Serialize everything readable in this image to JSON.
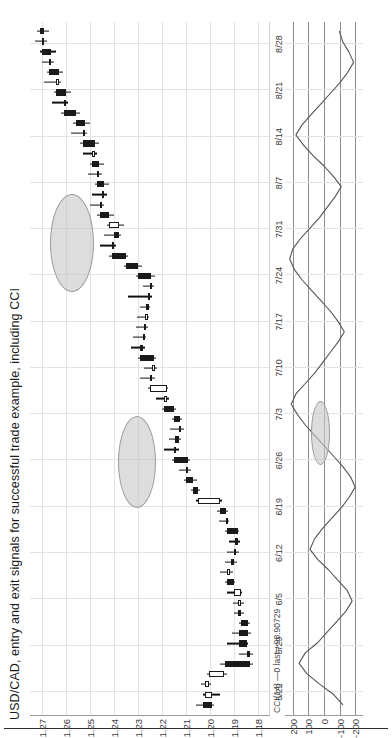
{
  "chart": {
    "title": "USD/CAD, entry and exit signals for successful trade example, including CCI",
    "instrument": "USD/CAD"
  },
  "price_axis": {
    "labels": [
      "1.27",
      "1.26",
      "1.25",
      "1.24",
      "1.23",
      "1.22",
      "1.21",
      "1.20",
      "1.19",
      "1.18"
    ]
  },
  "date_axis": {
    "labels": [
      "5/22",
      "5/29",
      "6/5",
      "6/12",
      "6/19",
      "6/26",
      "7/3",
      "7/10",
      "7/17",
      "7/24",
      "7/31",
      "8/7",
      "8/14",
      "8/21",
      "8/28"
    ]
  },
  "indicator": {
    "label": "CCI(14) —0 last=-98.90729",
    "name": "CCI",
    "period": 14,
    "last_value": -98.90729,
    "axis_labels": [
      "200",
      "100",
      "0",
      "-100",
      "-200"
    ]
  },
  "annotations": [
    {
      "name": "entry-signal-ellipse",
      "panel": "price"
    },
    {
      "name": "exit-signal-ellipse",
      "panel": "price"
    },
    {
      "name": "cci-signal-ellipse",
      "panel": "cci"
    }
  ],
  "colors": {
    "up_candle": "#ffffff",
    "down_candle": "#1a1a1a",
    "outline": "#1a1a1a",
    "gridline": "#e3e3e3",
    "axis": "#8d8d8d",
    "annotation_fill": "#c8c8c8",
    "annotation_stroke": "#9b9b9b",
    "indicator_line": "#555555",
    "text": "#1c1c1c"
  },
  "chart_data": {
    "type": "candlestick",
    "title": "USD/CAD, entry and exit signals for successful trade example, including CCI",
    "xlabel": "",
    "ylabel": "",
    "ylim": [
      1.175,
      1.275
    ],
    "grid": true,
    "legend": "none",
    "x": [
      "5/22",
      "5/29",
      "6/5",
      "6/12",
      "6/19",
      "6/26",
      "7/3",
      "7/10",
      "7/17",
      "7/24",
      "7/31",
      "8/7",
      "8/14",
      "8/21",
      "8/28"
    ],
    "yticks": [
      1.27,
      1.26,
      1.25,
      1.24,
      1.23,
      1.22,
      1.21,
      1.2,
      1.19,
      1.18
    ],
    "candles": [
      {
        "o": 1.203,
        "h": 1.206,
        "l": 1.1985,
        "c": 1.199,
        "dir": "down"
      },
      {
        "o": 1.199,
        "h": 1.203,
        "l": 1.196,
        "c": 1.202,
        "dir": "up"
      },
      {
        "o": 1.202,
        "h": 1.204,
        "l": 1.1995,
        "c": 1.2005,
        "dir": "up"
      },
      {
        "o": 1.2005,
        "h": 1.2015,
        "l": 1.193,
        "c": 1.194,
        "dir": "up"
      },
      {
        "o": 1.194,
        "h": 1.196,
        "l": 1.182,
        "c": 1.1835,
        "dir": "down"
      },
      {
        "o": 1.1835,
        "h": 1.188,
        "l": 1.182,
        "c": 1.1845,
        "dir": "down"
      },
      {
        "o": 1.1845,
        "h": 1.193,
        "l": 1.184,
        "c": 1.188,
        "dir": "down"
      },
      {
        "o": 1.188,
        "h": 1.191,
        "l": 1.183,
        "c": 1.184,
        "dir": "down"
      },
      {
        "o": 1.184,
        "h": 1.188,
        "l": 1.1835,
        "c": 1.187,
        "dir": "down"
      },
      {
        "o": 1.187,
        "h": 1.19,
        "l": 1.186,
        "c": 1.1885,
        "dir": "down"
      },
      {
        "o": 1.1885,
        "h": 1.1905,
        "l": 1.186,
        "c": 1.187,
        "dir": "up"
      },
      {
        "o": 1.187,
        "h": 1.193,
        "l": 1.1865,
        "c": 1.19,
        "dir": "up"
      },
      {
        "o": 1.19,
        "h": 1.194,
        "l": 1.1895,
        "c": 1.193,
        "dir": "down"
      },
      {
        "o": 1.193,
        "h": 1.196,
        "l": 1.1905,
        "c": 1.1915,
        "dir": "up"
      },
      {
        "o": 1.1915,
        "h": 1.194,
        "l": 1.189,
        "c": 1.19,
        "dir": "down"
      },
      {
        "o": 1.19,
        "h": 1.193,
        "l": 1.188,
        "c": 1.1895,
        "dir": "down"
      },
      {
        "o": 1.1895,
        "h": 1.192,
        "l": 1.1875,
        "c": 1.1885,
        "dir": "down"
      },
      {
        "o": 1.1885,
        "h": 1.194,
        "l": 1.188,
        "c": 1.193,
        "dir": "down"
      },
      {
        "o": 1.193,
        "h": 1.1965,
        "l": 1.192,
        "c": 1.1935,
        "dir": "up"
      },
      {
        "o": 1.1935,
        "h": 1.197,
        "l": 1.1925,
        "c": 1.196,
        "dir": "down"
      },
      {
        "o": 1.196,
        "h": 1.206,
        "l": 1.195,
        "c": 1.205,
        "dir": "up"
      },
      {
        "o": 1.205,
        "h": 1.208,
        "l": 1.204,
        "c": 1.207,
        "dir": "down"
      },
      {
        "o": 1.207,
        "h": 1.211,
        "l": 1.2055,
        "c": 1.21,
        "dir": "down"
      },
      {
        "o": 1.21,
        "h": 1.213,
        "l": 1.208,
        "c": 1.209,
        "dir": "down"
      },
      {
        "o": 1.209,
        "h": 1.216,
        "l": 1.2085,
        "c": 1.215,
        "dir": "down"
      },
      {
        "o": 1.215,
        "h": 1.219,
        "l": 1.213,
        "c": 1.2145,
        "dir": "up"
      },
      {
        "o": 1.2145,
        "h": 1.217,
        "l": 1.212,
        "c": 1.213,
        "dir": "down"
      },
      {
        "o": 1.213,
        "h": 1.2165,
        "l": 1.211,
        "c": 1.2125,
        "dir": "up"
      },
      {
        "o": 1.2125,
        "h": 1.216,
        "l": 1.2115,
        "c": 1.215,
        "dir": "down"
      },
      {
        "o": 1.215,
        "h": 1.22,
        "l": 1.214,
        "c": 1.219,
        "dir": "down"
      },
      {
        "o": 1.219,
        "h": 1.2225,
        "l": 1.217,
        "c": 1.218,
        "dir": "up"
      },
      {
        "o": 1.218,
        "h": 1.226,
        "l": 1.2175,
        "c": 1.225,
        "dir": "up"
      },
      {
        "o": 1.225,
        "h": 1.229,
        "l": 1.223,
        "c": 1.224,
        "dir": "down"
      },
      {
        "o": 1.224,
        "h": 1.2275,
        "l": 1.222,
        "c": 1.2235,
        "dir": "up"
      },
      {
        "o": 1.2235,
        "h": 1.23,
        "l": 1.2225,
        "c": 1.229,
        "dir": "down"
      },
      {
        "o": 1.229,
        "h": 1.233,
        "l": 1.227,
        "c": 1.228,
        "dir": "down"
      },
      {
        "o": 1.228,
        "h": 1.232,
        "l": 1.2265,
        "c": 1.2275,
        "dir": "up"
      },
      {
        "o": 1.2275,
        "h": 1.231,
        "l": 1.226,
        "c": 1.227,
        "dir": "down"
      },
      {
        "o": 1.227,
        "h": 1.2305,
        "l": 1.2255,
        "c": 1.2265,
        "dir": "up"
      },
      {
        "o": 1.2265,
        "h": 1.229,
        "l": 1.225,
        "c": 1.226,
        "dir": "down"
      },
      {
        "o": 1.226,
        "h": 1.234,
        "l": 1.224,
        "c": 1.225,
        "dir": "up"
      },
      {
        "o": 1.225,
        "h": 1.228,
        "l": 1.2235,
        "c": 1.2245,
        "dir": "down"
      },
      {
        "o": 1.2245,
        "h": 1.231,
        "l": 1.223,
        "c": 1.23,
        "dir": "down"
      },
      {
        "o": 1.23,
        "h": 1.236,
        "l": 1.2285,
        "c": 1.235,
        "dir": "down"
      },
      {
        "o": 1.235,
        "h": 1.242,
        "l": 1.234,
        "c": 1.241,
        "dir": "down"
      },
      {
        "o": 1.241,
        "h": 1.246,
        "l": 1.239,
        "c": 1.24,
        "dir": "up"
      },
      {
        "o": 1.24,
        "h": 1.244,
        "l": 1.237,
        "c": 1.238,
        "dir": "down"
      },
      {
        "o": 1.238,
        "h": 1.243,
        "l": 1.236,
        "c": 1.242,
        "dir": "up"
      },
      {
        "o": 1.242,
        "h": 1.247,
        "l": 1.24,
        "c": 1.246,
        "dir": "down"
      },
      {
        "o": 1.246,
        "h": 1.25,
        "l": 1.244,
        "c": 1.245,
        "dir": "up"
      },
      {
        "o": 1.245,
        "h": 1.249,
        "l": 1.243,
        "c": 1.244,
        "dir": "down"
      },
      {
        "o": 1.244,
        "h": 1.248,
        "l": 1.242,
        "c": 1.247,
        "dir": "down"
      },
      {
        "o": 1.247,
        "h": 1.251,
        "l": 1.245,
        "c": 1.246,
        "dir": "up"
      },
      {
        "o": 1.246,
        "h": 1.25,
        "l": 1.244,
        "c": 1.249,
        "dir": "down"
      },
      {
        "o": 1.249,
        "h": 1.253,
        "l": 1.247,
        "c": 1.248,
        "dir": "up"
      },
      {
        "o": 1.248,
        "h": 1.254,
        "l": 1.246,
        "c": 1.253,
        "dir": "down"
      },
      {
        "o": 1.253,
        "h": 1.258,
        "l": 1.251,
        "c": 1.252,
        "dir": "up"
      },
      {
        "o": 1.252,
        "h": 1.257,
        "l": 1.25,
        "c": 1.256,
        "dir": "down"
      },
      {
        "o": 1.256,
        "h": 1.262,
        "l": 1.254,
        "c": 1.261,
        "dir": "down"
      },
      {
        "o": 1.261,
        "h": 1.266,
        "l": 1.259,
        "c": 1.26,
        "dir": "up"
      },
      {
        "o": 1.26,
        "h": 1.265,
        "l": 1.258,
        "c": 1.264,
        "dir": "down"
      },
      {
        "o": 1.264,
        "h": 1.269,
        "l": 1.262,
        "c": 1.263,
        "dir": "up"
      },
      {
        "o": 1.263,
        "h": 1.268,
        "l": 1.261,
        "c": 1.267,
        "dir": "down"
      },
      {
        "o": 1.267,
        "h": 1.27,
        "l": 1.265,
        "c": 1.266,
        "dir": "up"
      },
      {
        "o": 1.266,
        "h": 1.271,
        "l": 1.264,
        "c": 1.27,
        "dir": "down"
      },
      {
        "o": 1.27,
        "h": 1.273,
        "l": 1.268,
        "c": 1.269,
        "dir": "up"
      },
      {
        "o": 1.269,
        "h": 1.272,
        "l": 1.267,
        "c": 1.271,
        "dir": "down"
      }
    ],
    "indicator_series": {
      "name": "CCI(14)",
      "ylim": [
        -250,
        250
      ],
      "yticks": [
        200,
        100,
        0,
        -100,
        -200
      ],
      "values": [
        -120,
        -60,
        30,
        110,
        160,
        120,
        40,
        -20,
        -80,
        -140,
        -180,
        -150,
        -90,
        -30,
        40,
        90,
        60,
        10,
        -50,
        -110,
        -160,
        -200,
        -170,
        -120,
        -60,
        0,
        60,
        120,
        170,
        210,
        180,
        120,
        60,
        10,
        -40,
        -90,
        -130,
        -90,
        -40,
        20,
        80,
        140,
        190,
        220,
        200,
        150,
        90,
        30,
        -20,
        -70,
        -110,
        -60,
        0,
        70,
        130,
        180,
        140,
        80,
        20,
        -40,
        -100,
        -150,
        -190,
        -160,
        -120,
        -99
      ]
    }
  }
}
